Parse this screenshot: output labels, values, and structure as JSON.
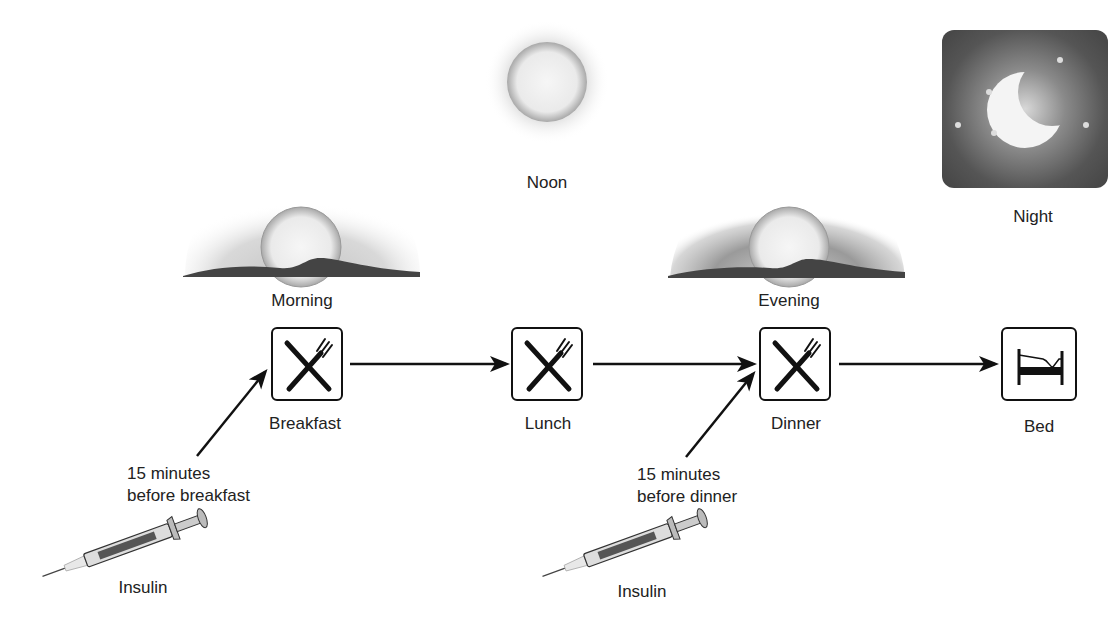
{
  "diagram": {
    "times_of_day": [
      {
        "id": "morning",
        "label": "Morning",
        "icon": "sunrise-icon"
      },
      {
        "id": "noon",
        "label": "Noon",
        "icon": "sun-icon"
      },
      {
        "id": "evening",
        "label": "Evening",
        "icon": "sunset-icon"
      },
      {
        "id": "night",
        "label": "Night",
        "icon": "moon-icon"
      }
    ],
    "events": [
      {
        "id": "breakfast",
        "label": "Breakfast",
        "icon": "fork-knife-icon"
      },
      {
        "id": "lunch",
        "label": "Lunch",
        "icon": "fork-knife-icon"
      },
      {
        "id": "dinner",
        "label": "Dinner",
        "icon": "fork-knife-icon"
      },
      {
        "id": "bed",
        "label": "Bed",
        "icon": "bed-icon"
      }
    ],
    "injections": [
      {
        "line1": "15 minutes",
        "line2": "before breakfast",
        "label": "Insulin",
        "icon": "syringe-icon",
        "target": "breakfast"
      },
      {
        "line1": "15 minutes",
        "line2": "before dinner",
        "label": "Insulin",
        "icon": "syringe-icon",
        "target": "dinner"
      }
    ],
    "colors": {
      "line": "#111111",
      "ground": "#444444",
      "night_bg": "#4a4a4a"
    }
  }
}
